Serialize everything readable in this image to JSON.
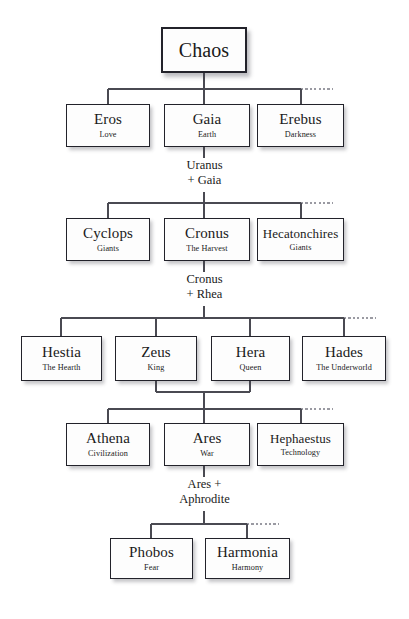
{
  "diagram": {
    "type": "genealogy-tree",
    "line_color": "#4a4a52",
    "dotted_color": "#9a9aa2",
    "box_border_color": "#22222a",
    "box_fill": "#fdfdfd"
  },
  "generations": [
    {
      "id": "gen0",
      "nodes": [
        {
          "name": "Chaos",
          "subtitle": ""
        }
      ]
    },
    {
      "id": "gen1",
      "nodes": [
        {
          "name": "Eros",
          "subtitle": "Love"
        },
        {
          "name": "Gaia",
          "subtitle": "Earth"
        },
        {
          "name": "Erebus",
          "subtitle": "Darkness"
        }
      ]
    },
    {
      "id": "gen2",
      "nodes": [
        {
          "name": "Cyclops",
          "subtitle": "Giants"
        },
        {
          "name": "Cronus",
          "subtitle": "The Harvest"
        },
        {
          "name": "Hecatonchires",
          "subtitle": "Giants"
        }
      ]
    },
    {
      "id": "gen3",
      "nodes": [
        {
          "name": "Hestia",
          "subtitle": "The Hearth"
        },
        {
          "name": "Zeus",
          "subtitle": "King"
        },
        {
          "name": "Hera",
          "subtitle": "Queen"
        },
        {
          "name": "Hades",
          "subtitle": "The Underworld"
        }
      ]
    },
    {
      "id": "gen4",
      "nodes": [
        {
          "name": "Athena",
          "subtitle": "Civilization"
        },
        {
          "name": "Ares",
          "subtitle": "War"
        },
        {
          "name": "Hephaestus",
          "subtitle": "Technology"
        }
      ]
    },
    {
      "id": "gen5",
      "nodes": [
        {
          "name": "Phobos",
          "subtitle": "Fear"
        },
        {
          "name": "Harmonia",
          "subtitle": "Harmony"
        }
      ]
    }
  ],
  "unions": [
    {
      "id": "union1",
      "line1": "Uranus",
      "line2": "+ Gaia"
    },
    {
      "id": "union2",
      "line1": "Cronus",
      "line2": "+ Rhea"
    },
    {
      "id": "union3",
      "line1": "Ares +",
      "line2": "Aphrodite"
    }
  ]
}
